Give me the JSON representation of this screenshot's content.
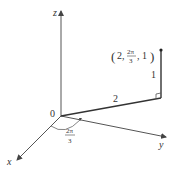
{
  "diagram": {
    "axes": {
      "x": "x",
      "y": "y",
      "z": "z"
    },
    "origin_label": "0",
    "point_label": {
      "open": "(2,",
      "num": "2π",
      "den": "3",
      "close": ", 1)"
    },
    "radius_label": "2",
    "height_label": "1",
    "angle_label": {
      "num": "2π",
      "den": "3"
    }
  }
}
